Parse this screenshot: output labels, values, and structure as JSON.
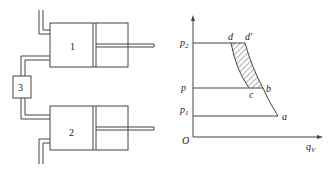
{
  "schematic": {
    "cylinder_1_label": "1",
    "cylinder_2_label": "2",
    "cooler_label": "3"
  },
  "chart": {
    "axis_y_origin": "O",
    "axis_x_label": "q",
    "axis_x_sub": "V",
    "pressure_labels": {
      "p2": "p",
      "p2_sub": "2",
      "p": "p",
      "p1": "p",
      "p1_sub": "1"
    },
    "points": {
      "a": "a",
      "b": "b",
      "c": "c",
      "d": "d",
      "d_prime": "d′"
    }
  },
  "colors": {
    "line": "#333333",
    "background": "#ffffff"
  }
}
